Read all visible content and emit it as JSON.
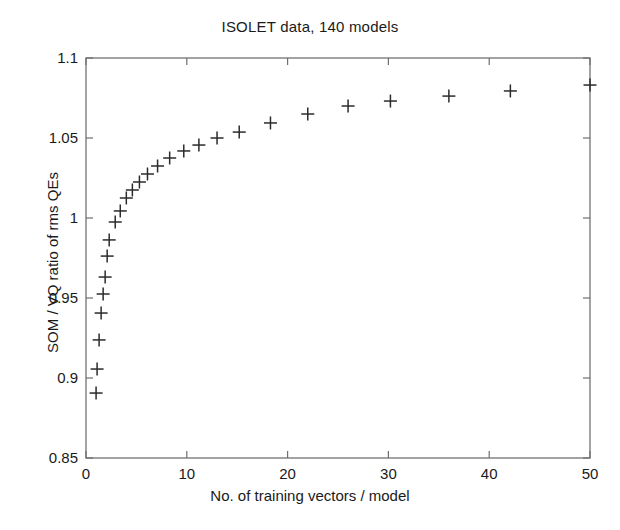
{
  "chart_data": {
    "type": "scatter",
    "title": "ISOLET data, 140 models",
    "xlabel": "No. of training vectors / model",
    "ylabel": "SOM / VQ ratio of rms QEs",
    "xlim": [
      0,
      50
    ],
    "ylim": [
      0.85,
      1.1
    ],
    "xticks": [
      0,
      10,
      20,
      30,
      40,
      50
    ],
    "xtick_labels": [
      "0",
      "10",
      "20",
      "30",
      "40",
      "50"
    ],
    "yticks": [
      0.85,
      0.9,
      0.95,
      1.0,
      1.05,
      1.1
    ],
    "ytick_labels": [
      "0.85",
      "0.9",
      "0.95",
      "1",
      "1.05",
      "1.1"
    ],
    "grid": false,
    "legend": null,
    "marker": "plus",
    "marker_color": "#2b2b2b",
    "series": [
      {
        "name": "SOM / VQ rms QE ratio",
        "points": [
          [
            1.0,
            0.8906
          ],
          [
            1.1,
            0.9056
          ],
          [
            1.3,
            0.9238
          ],
          [
            1.5,
            0.9406
          ],
          [
            1.7,
            0.9525
          ],
          [
            1.9,
            0.9631
          ],
          [
            2.1,
            0.9762
          ],
          [
            2.3,
            0.9863
          ],
          [
            2.9,
            0.9975
          ],
          [
            3.4,
            1.0044
          ],
          [
            4.0,
            1.0125
          ],
          [
            4.6,
            1.0175
          ],
          [
            5.3,
            1.0225
          ],
          [
            6.1,
            1.0275
          ],
          [
            7.1,
            1.0325
          ],
          [
            8.3,
            1.0375
          ],
          [
            9.7,
            1.0419
          ],
          [
            11.2,
            1.0456
          ],
          [
            13.0,
            1.05
          ],
          [
            15.2,
            1.0537
          ],
          [
            18.3,
            1.0594
          ],
          [
            22.0,
            1.065
          ],
          [
            26.0,
            1.07
          ],
          [
            30.2,
            1.0731
          ],
          [
            36.0,
            1.0762
          ],
          [
            42.1,
            1.0794
          ],
          [
            50.0,
            1.0831
          ]
        ]
      }
    ]
  },
  "axes": {
    "plot_left_px": 86,
    "plot_right_px": 590,
    "plot_top_px": 58,
    "plot_bottom_px": 458
  }
}
